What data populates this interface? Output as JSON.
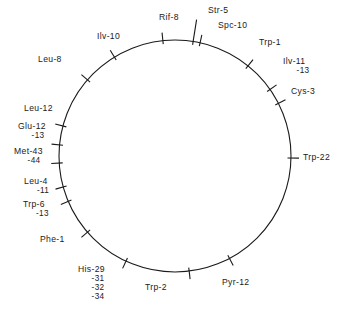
{
  "figure": {
    "type": "circular-genetic-map",
    "circle": {
      "cx": 175,
      "cy": 156,
      "r": 116,
      "stroke": "#1a1a1a",
      "stroke_width": 1.1
    },
    "markers": [
      {
        "id": "rif-8",
        "label": "Rif-8",
        "angle_deg": 264.0,
        "tick_outer": 8,
        "tick_type": "radial",
        "text_x": 159,
        "text_y": 20,
        "anchor": "start",
        "sublabels": []
      },
      {
        "id": "str-5",
        "label": "Str-5",
        "angle_deg": 279.0,
        "tick_outer": 22,
        "tick_type": "leader",
        "text_x": 208,
        "text_y": 13,
        "anchor": "start",
        "sublabels": []
      },
      {
        "id": "spc-10",
        "label": "Spc-10",
        "angle_deg": 282.5,
        "tick_outer": 8,
        "tick_type": "radial",
        "text_x": 218,
        "text_y": 28,
        "anchor": "start",
        "sublabels": []
      },
      {
        "id": "trp-1",
        "label": "Trp-1",
        "angle_deg": 309.0,
        "tick_outer": 8,
        "tick_type": "radial",
        "text_x": 259,
        "text_y": 45,
        "anchor": "start",
        "sublabels": []
      },
      {
        "id": "ilv-11",
        "label": "Ilv-11",
        "angle_deg": 325.0,
        "tick_outer": 8,
        "tick_type": "radial",
        "text_x": 283,
        "text_y": 64,
        "anchor": "start",
        "sublabels": [
          "-13"
        ]
      },
      {
        "id": "cys-3",
        "label": "Cys-3",
        "angle_deg": 333.0,
        "tick_outer": 8,
        "tick_type": "radial",
        "text_x": 291,
        "text_y": 94,
        "anchor": "start",
        "sublabels": []
      },
      {
        "id": "trp-22",
        "label": "Trp-22",
        "angle_deg": 1.0,
        "tick_outer": 8,
        "tick_type": "radial",
        "text_x": 303,
        "text_y": 160,
        "anchor": "start",
        "sublabels": []
      },
      {
        "id": "pyr-12",
        "label": "Pyr-12",
        "angle_deg": 62.0,
        "tick_outer": 8,
        "tick_type": "radial",
        "text_x": 222,
        "text_y": 285,
        "anchor": "start",
        "sublabels": []
      },
      {
        "id": "trp-2",
        "label": "Trp-2",
        "angle_deg": 83.0,
        "tick_outer": 8,
        "tick_type": "radial",
        "text_x": 145,
        "text_y": 290,
        "anchor": "start",
        "sublabels": []
      },
      {
        "id": "his-29",
        "label": "His-29",
        "angle_deg": 115.0,
        "tick_outer": 8,
        "tick_type": "radial",
        "text_x": 78,
        "text_y": 272,
        "anchor": "start",
        "sublabels": [
          "-31",
          "-32",
          "-34"
        ]
      },
      {
        "id": "phe-1",
        "label": "Phe-1",
        "angle_deg": 139.0,
        "tick_outer": 8,
        "tick_type": "radial",
        "text_x": 40,
        "text_y": 242,
        "anchor": "start",
        "sublabels": []
      },
      {
        "id": "trp-6",
        "label": "Trp-6",
        "angle_deg": 157.0,
        "tick_outer": 8,
        "tick_type": "radial",
        "text_x": 23,
        "text_y": 207,
        "anchor": "start",
        "sublabels": [
          "-13"
        ]
      },
      {
        "id": "leu-4",
        "label": "Leu-4",
        "angle_deg": 164.5,
        "tick_outer": 8,
        "tick_type": "radial",
        "text_x": 24,
        "text_y": 184,
        "anchor": "start",
        "sublabels": [
          "-11"
        ]
      },
      {
        "id": "met-43",
        "label": "Met-43",
        "angle_deg": 176.5,
        "tick_outer": 8,
        "tick_type": "radial",
        "text_x": 14,
        "text_y": 154,
        "anchor": "start",
        "sublabels": [
          "-44"
        ]
      },
      {
        "id": "glu-12",
        "label": "Glu-12",
        "angle_deg": 185.5,
        "tick_outer": 8,
        "tick_type": "radial",
        "text_x": 18,
        "text_y": 129,
        "anchor": "start",
        "sublabels": [
          "-13"
        ]
      },
      {
        "id": "leu-12",
        "label": "Leu-12",
        "angle_deg": 195.0,
        "tick_outer": 8,
        "tick_type": "radial",
        "text_x": 24,
        "text_y": 111,
        "anchor": "start",
        "sublabels": []
      },
      {
        "id": "leu-8",
        "label": "Leu-8",
        "angle_deg": 221.0,
        "tick_outer": 8,
        "tick_type": "radial",
        "text_x": 38,
        "text_y": 62,
        "anchor": "start",
        "sublabels": []
      },
      {
        "id": "ilv-10",
        "label": "Ilv-10",
        "angle_deg": 238.5,
        "tick_outer": 8,
        "tick_type": "radial",
        "text_x": 97,
        "text_y": 39,
        "anchor": "start",
        "sublabels": []
      }
    ],
    "labels_flat": {
      "rif_8": "Rif-8",
      "str_5": "Str-5",
      "spc_10": "Spc-10",
      "trp_1": "Trp-1",
      "ilv_11": "Ilv-11",
      "ilv_11_sub": "-13",
      "cys_3": "Cys-3",
      "trp_22": "Trp-22",
      "pyr_12": "Pyr-12",
      "trp_2": "Trp-2",
      "his_29": "His-29",
      "his_31": "-31",
      "his_32": "-32",
      "his_34": "-34",
      "phe_1": "Phe-1",
      "trp_6": "Trp-6",
      "trp_6_sub": "-13",
      "leu_4": "Leu-4",
      "leu_4_sub": "-11",
      "met_43": "Met-43",
      "met_43_sub": "-44",
      "glu_12": "Glu-12",
      "glu_12_sub": "-13",
      "leu_12": "Leu-12",
      "leu_8": "Leu-8",
      "ilv_10": "Ilv-10"
    }
  }
}
